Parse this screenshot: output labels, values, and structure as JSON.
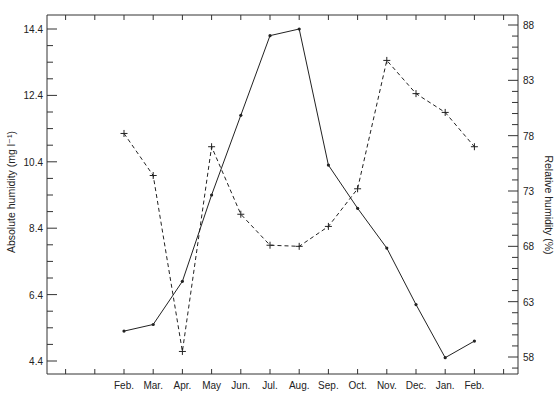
{
  "chart_data": {
    "type": "line",
    "title": "",
    "xlabel": "",
    "ylabel": "Absolute humidity (mg l⁻¹)",
    "ylabel_right": "Relative humidity (%)",
    "categories": [
      "Feb.",
      "Mar.",
      "Apr.",
      "May",
      "Jun.",
      "Jul.",
      "Aug.",
      "Sep.",
      "Oct.",
      "Nov.",
      "Dec.",
      "Jan.",
      "Feb."
    ],
    "ylim": [
      4.4,
      14.4
    ],
    "ylim_right": [
      58,
      88
    ],
    "yticks": [
      "4.4",
      "6.4",
      "8.4",
      "10.4",
      "12.4",
      "14.4"
    ],
    "yticks_right": [
      "58",
      "63",
      "68",
      "73",
      "78",
      "83",
      "88"
    ],
    "grid": false,
    "legend": "none",
    "series": [
      {
        "name": "Absolute humidity",
        "axis": "left",
        "style": "solid",
        "marker": "dot",
        "values": [
          5.3,
          5.5,
          6.8,
          9.4,
          11.8,
          14.2,
          14.4,
          10.3,
          9.0,
          7.8,
          6.1,
          4.5,
          5.0
        ]
      },
      {
        "name": "Relative humidity",
        "axis": "right",
        "style": "dashed",
        "marker": "plus",
        "values": [
          78.2,
          74.4,
          58.5,
          77.0,
          70.9,
          68.1,
          68.0,
          69.8,
          73.2,
          84.8,
          81.8,
          80.1,
          77.0
        ]
      }
    ]
  },
  "colors": {
    "line": "#222222",
    "axis": "#333333"
  }
}
